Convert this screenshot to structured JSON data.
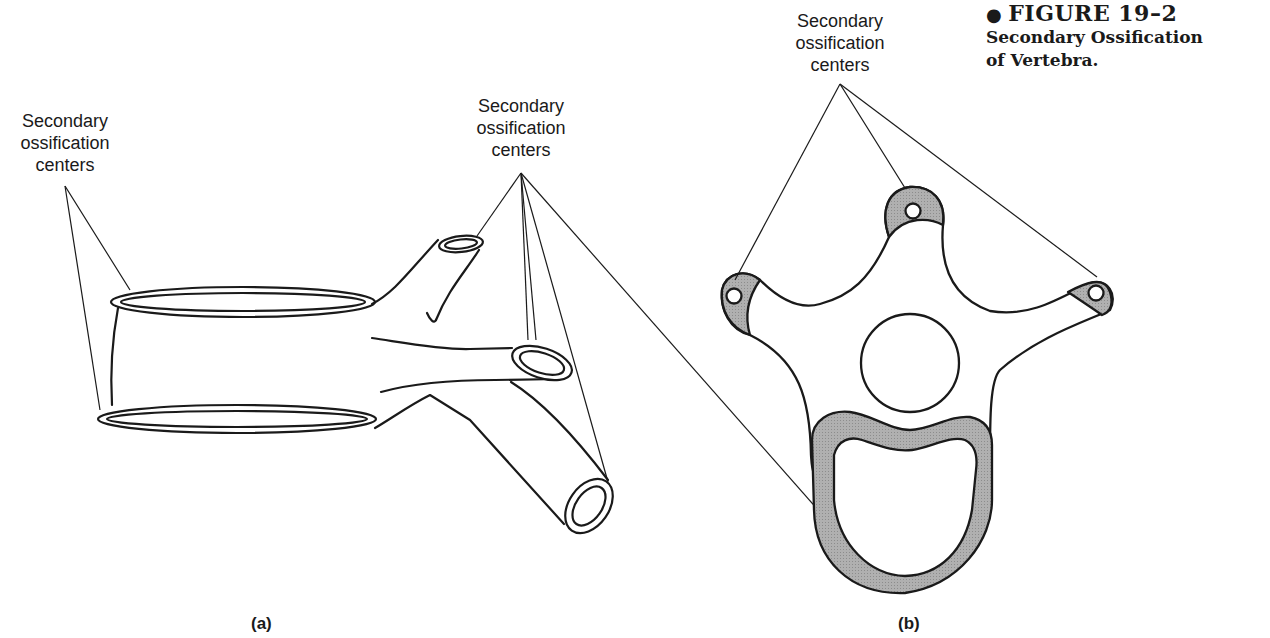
{
  "figure": {
    "bullet": "●",
    "number": "FIGURE 19–2",
    "title_line1": "Secondary Ossification",
    "title_line2": "of Vertebra."
  },
  "panels": {
    "a": {
      "label": "(a)",
      "callouts": [
        {
          "lines": [
            "Secondary",
            "ossification",
            "centers"
          ],
          "position": "left"
        },
        {
          "lines": [
            "Secondary",
            "ossification",
            "centers"
          ],
          "position": "top-middle"
        }
      ]
    },
    "b": {
      "label": "(b)",
      "callouts": [
        {
          "lines": [
            "Secondary",
            "ossification",
            "centers"
          ],
          "position": "top"
        }
      ]
    }
  },
  "colors": {
    "ink": "#1a1a1a",
    "cartilage_fill": "#a8a8a8",
    "background": "#ffffff"
  }
}
